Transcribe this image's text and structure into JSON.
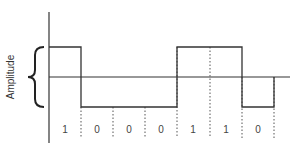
{
  "diagram": {
    "type": "digital-signal-waveform",
    "ylabel": "Amplitude",
    "bits": [
      "1",
      "0",
      "0",
      "0",
      "1",
      "1",
      "0"
    ],
    "levels": {
      "high": "1",
      "low": "0"
    },
    "colors": {
      "line": "#333333",
      "text": "#444444",
      "background": "#ffffff"
    }
  }
}
